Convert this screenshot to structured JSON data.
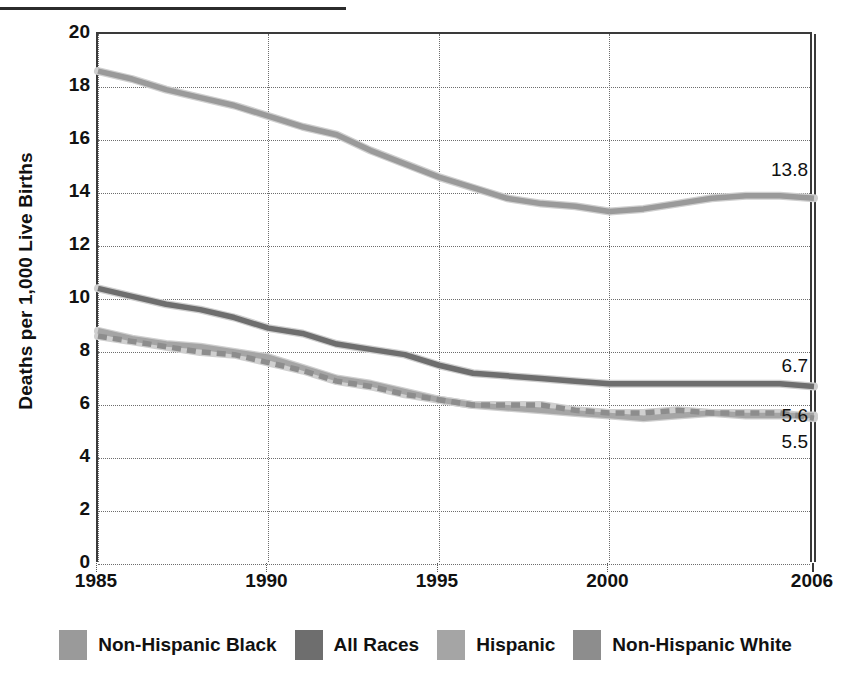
{
  "chart_data": {
    "type": "line",
    "title": "",
    "xlabel": "",
    "ylabel": "Deaths per 1,000 Live Births",
    "xlim": [
      1985,
      2006
    ],
    "ylim": [
      0,
      20
    ],
    "yticks": [
      0,
      2,
      4,
      6,
      8,
      10,
      12,
      14,
      16,
      18,
      20
    ],
    "xticks": [
      1985,
      1990,
      1995,
      2000,
      2006
    ],
    "grid": true,
    "legend_position": "bottom",
    "x": [
      1985,
      1986,
      1987,
      1988,
      1989,
      1990,
      1991,
      1992,
      1993,
      1994,
      1995,
      1996,
      1997,
      1998,
      1999,
      2000,
      2001,
      2002,
      2003,
      2004,
      2005,
      2006
    ],
    "series": [
      {
        "name": "Non-Hispanic Black",
        "color": "#9a9a9a",
        "style": "solid",
        "end_label": "13.8",
        "values": [
          18.6,
          18.3,
          17.9,
          17.6,
          17.3,
          16.9,
          16.5,
          16.2,
          15.6,
          15.1,
          14.6,
          14.2,
          13.8,
          13.6,
          13.5,
          13.3,
          13.4,
          13.6,
          13.8,
          13.9,
          13.9,
          13.8
        ]
      },
      {
        "name": "All Races",
        "color": "#6e6e6e",
        "style": "solid",
        "end_label": "6.7",
        "values": [
          10.4,
          10.1,
          9.8,
          9.6,
          9.3,
          8.9,
          8.7,
          8.3,
          8.1,
          7.9,
          7.5,
          7.2,
          7.1,
          7.0,
          6.9,
          6.8,
          6.8,
          6.8,
          6.8,
          6.8,
          6.8,
          6.7
        ]
      },
      {
        "name": "Hispanic",
        "color": "#a5a5a5",
        "style": "solid",
        "end_label": "5.6",
        "values": [
          8.8,
          8.5,
          8.3,
          8.2,
          8.0,
          7.8,
          7.4,
          7.0,
          6.8,
          6.5,
          6.2,
          6.0,
          5.9,
          5.8,
          5.7,
          5.6,
          5.5,
          5.6,
          5.7,
          5.6,
          5.6,
          5.6
        ]
      },
      {
        "name": "Non-Hispanic White",
        "color": "#8d8d8d",
        "style": "dashed",
        "end_label": "5.5",
        "values": [
          8.6,
          8.4,
          8.2,
          8.0,
          7.9,
          7.6,
          7.3,
          6.9,
          6.7,
          6.4,
          6.2,
          6.0,
          6.0,
          6.0,
          5.8,
          5.7,
          5.7,
          5.8,
          5.7,
          5.7,
          5.7,
          5.5
        ]
      }
    ],
    "value_labels": [
      {
        "text": "13.8",
        "series": "Non-Hispanic Black",
        "value": 13.8
      },
      {
        "text": "6.7",
        "series": "All Races",
        "value": 6.7
      },
      {
        "text": "5.6",
        "series": "Hispanic",
        "value": 5.6
      },
      {
        "text": "5.5",
        "series": "Non-Hispanic White",
        "value": 5.5
      }
    ]
  },
  "legend": {
    "items": [
      {
        "label": "Non-Hispanic Black",
        "color": "#9a9a9a"
      },
      {
        "label": "All Races",
        "color": "#6e6e6e"
      },
      {
        "label": "Hispanic",
        "color": "#a5a5a5"
      },
      {
        "label": "Non-Hispanic White",
        "color": "#8d8d8d"
      }
    ]
  },
  "axis": {
    "y_title": "Deaths per 1,000 Live Births",
    "y_tick_labels": [
      "20",
      "18",
      "16",
      "14",
      "12",
      "10",
      "8",
      "6",
      "4",
      "2",
      "0"
    ],
    "x_tick_labels": [
      "1985",
      "1990",
      "1995",
      "2000",
      "2006"
    ]
  }
}
